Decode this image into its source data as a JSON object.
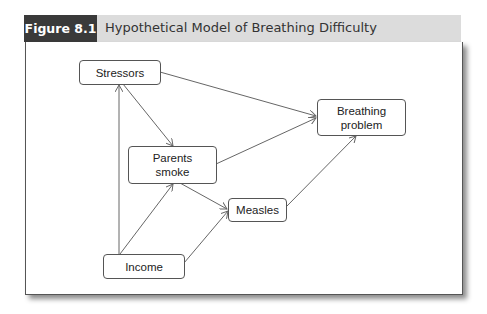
{
  "figure": {
    "label": "Figure 8.1",
    "title": "Hypothetical Model of Breathing Difficulty"
  },
  "diagram": {
    "nodes": {
      "stressors": "Stressors",
      "breathing_line1": "Breathing",
      "breathing_line2": "problem",
      "parents_line1": "Parents",
      "parents_line2": "smoke",
      "measles": "Measles",
      "income": "Income"
    },
    "edges": [
      {
        "from": "Stressors",
        "to": "Breathing problem"
      },
      {
        "from": "Stressors",
        "to": "Parents smoke"
      },
      {
        "from": "Income",
        "to": "Stressors"
      },
      {
        "from": "Income",
        "to": "Parents smoke"
      },
      {
        "from": "Income",
        "to": "Measles"
      },
      {
        "from": "Parents smoke",
        "to": "Breathing problem"
      },
      {
        "from": "Parents smoke",
        "to": "Measles"
      },
      {
        "from": "Measles",
        "to": "Breathing problem"
      }
    ],
    "colors": {
      "label_bg": "#3a3a3a",
      "title_bg": "#dcdcdc",
      "edge": "#666666"
    }
  }
}
